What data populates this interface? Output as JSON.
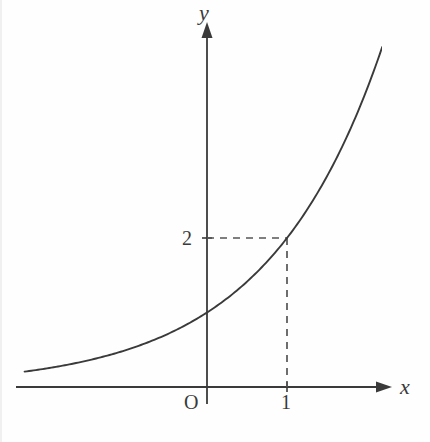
{
  "figure": {
    "background_color": "#fefefe",
    "stroke_color": "#3a3a3a",
    "dash_color": "#555555"
  },
  "labels": {
    "y_axis": "y",
    "x_axis": "x",
    "origin": "O",
    "tick_x_1": "1",
    "tick_y_2": "2"
  },
  "chart_data": {
    "type": "line",
    "title": "",
    "xlabel": "x",
    "ylabel": "y",
    "grid": false,
    "legend": "none",
    "function": "y = 2^x",
    "xlim": [
      -2.28,
      2.19
    ],
    "ylim": [
      0,
      4.9
    ],
    "x_ticks": [
      1
    ],
    "x_tick_labels": [
      "1"
    ],
    "y_ticks": [
      2
    ],
    "y_tick_labels": [
      "2"
    ],
    "origin_label": "O",
    "annotations": [
      {
        "type": "dashed-guide",
        "from": [
          0,
          2
        ],
        "to": [
          1,
          2
        ],
        "orientation": "horizontal"
      },
      {
        "type": "dashed-guide",
        "from": [
          1,
          0
        ],
        "to": [
          1,
          2
        ],
        "orientation": "vertical"
      }
    ],
    "marked_point": [
      1,
      2
    ],
    "x": [
      -2.28,
      -2.1,
      -1.9,
      -1.7,
      -1.5,
      -1.3,
      -1.1,
      -0.9,
      -0.7,
      -0.5,
      -0.3,
      -0.1,
      0,
      0.1,
      0.3,
      0.5,
      0.7,
      0.9,
      1.1,
      1.3,
      1.5,
      1.7,
      1.9,
      2.19
    ],
    "values": [
      0.206,
      0.233,
      0.268,
      0.308,
      0.354,
      0.406,
      0.467,
      0.536,
      0.616,
      0.707,
      0.812,
      0.933,
      1.0,
      1.072,
      1.231,
      1.414,
      1.625,
      1.866,
      2.143,
      2.462,
      2.828,
      3.249,
      3.732,
      4.563
    ]
  }
}
